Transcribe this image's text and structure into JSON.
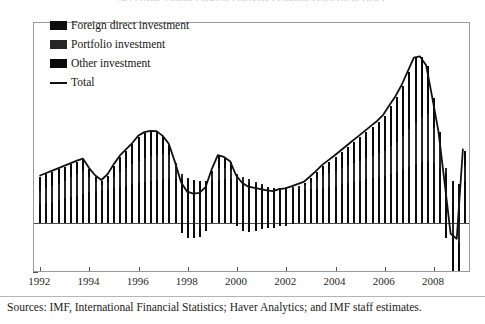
{
  "figure": {
    "title_clipped": "Net Private Capital Flows to Emerging Economies (percent of GDP)",
    "source_note": "Sources: IMF, International Financial Statistics; Haver Analytics; and IMF staff estimates."
  },
  "legend": {
    "position": "top-left-inside",
    "entries": [
      {
        "label": "Foreign direct investment",
        "key": "fdi",
        "marker": "filled-square",
        "color": "#0d0d0d"
      },
      {
        "label": "Portfolio investment",
        "key": "portfolio",
        "marker": "filled-square",
        "color": "#262626"
      },
      {
        "label": "Other investment",
        "key": "other",
        "marker": "filled-square",
        "color": "#0a0a0a"
      },
      {
        "label": "Total",
        "key": "total",
        "marker": "line",
        "color": "#111111"
      }
    ]
  },
  "chart_data": {
    "type": "bar",
    "subtype": "stacked-bar-with-overlay-line",
    "title": "Net Private Capital Flows to Emerging Economies (percent of GDP)",
    "xlabel": "",
    "ylabel": "",
    "ylim": [
      -2,
      8
    ],
    "yticks": [
      -2,
      0,
      2,
      4,
      6,
      8
    ],
    "ytick_labels": [
      "-2",
      "0",
      "2",
      "4",
      "6",
      "8"
    ],
    "xlim": [
      "1992Q1",
      "2009Q2"
    ],
    "xticks": [
      1992,
      1994,
      1996,
      1998,
      2000,
      2002,
      2004,
      2006,
      2008
    ],
    "xtick_labels": [
      "1992",
      "1994",
      "1996",
      "1998",
      "2000",
      "2002",
      "2004",
      "2006",
      "2008"
    ],
    "grid": false,
    "zero_line": true,
    "x": [
      "1992Q1",
      "1992Q2",
      "1992Q3",
      "1992Q4",
      "1993Q1",
      "1993Q2",
      "1993Q3",
      "1993Q4",
      "1994Q1",
      "1994Q2",
      "1994Q3",
      "1994Q4",
      "1995Q1",
      "1995Q2",
      "1995Q3",
      "1995Q4",
      "1996Q1",
      "1996Q2",
      "1996Q3",
      "1996Q4",
      "1997Q1",
      "1997Q2",
      "1997Q3",
      "1997Q4",
      "1998Q1",
      "1998Q2",
      "1998Q3",
      "1998Q4",
      "1999Q1",
      "1999Q2",
      "1999Q3",
      "1999Q4",
      "2000Q1",
      "2000Q2",
      "2000Q3",
      "2000Q4",
      "2001Q1",
      "2001Q2",
      "2001Q3",
      "2001Q4",
      "2002Q1",
      "2002Q2",
      "2002Q3",
      "2002Q4",
      "2003Q1",
      "2003Q2",
      "2003Q3",
      "2003Q4",
      "2004Q1",
      "2004Q2",
      "2004Q3",
      "2004Q4",
      "2005Q1",
      "2005Q2",
      "2005Q3",
      "2005Q4",
      "2006Q1",
      "2006Q2",
      "2006Q3",
      "2006Q4",
      "2007Q1",
      "2007Q2",
      "2007Q3",
      "2007Q4",
      "2008Q1",
      "2008Q2",
      "2008Q3",
      "2008Q4",
      "2009Q1",
      "2009Q2"
    ],
    "series": [
      {
        "name": "Foreign direct investment",
        "key": "fdi",
        "color": "#0d0d0d",
        "values": [
          0.75,
          0.8,
          0.85,
          0.92,
          1.0,
          1.05,
          1.1,
          1.18,
          1.25,
          1.3,
          1.32,
          1.35,
          1.4,
          1.45,
          1.5,
          1.55,
          1.6,
          1.65,
          1.7,
          1.72,
          1.75,
          1.78,
          1.8,
          1.78,
          1.75,
          1.72,
          1.7,
          1.68,
          1.7,
          1.72,
          1.75,
          1.78,
          1.7,
          1.65,
          1.6,
          1.55,
          1.5,
          1.45,
          1.42,
          1.4,
          1.38,
          1.36,
          1.35,
          1.34,
          1.35,
          1.38,
          1.42,
          1.46,
          1.5,
          1.55,
          1.6,
          1.65,
          1.7,
          1.75,
          1.8,
          1.85,
          1.9,
          1.98,
          2.05,
          2.15,
          2.25,
          2.35,
          2.45,
          2.5,
          2.4,
          2.25,
          2.0,
          1.7,
          1.55,
          1.7
        ]
      },
      {
        "name": "Portfolio investment",
        "key": "portfolio",
        "color": "#262626",
        "values": [
          0.55,
          0.6,
          0.62,
          0.65,
          0.7,
          0.8,
          0.85,
          0.9,
          0.6,
          0.35,
          0.2,
          0.3,
          0.45,
          0.6,
          0.7,
          0.8,
          0.9,
          0.95,
          1.0,
          1.02,
          1.0,
          0.95,
          0.6,
          0.2,
          0.05,
          -0.05,
          -0.1,
          0.0,
          0.3,
          0.5,
          0.45,
          0.35,
          0.25,
          0.2,
          0.15,
          0.1,
          0.05,
          0.0,
          -0.05,
          0.0,
          0.05,
          0.1,
          0.15,
          0.2,
          0.3,
          0.4,
          0.5,
          0.55,
          0.6,
          0.65,
          0.7,
          0.75,
          0.8,
          0.85,
          0.9,
          0.95,
          1.0,
          1.1,
          1.2,
          1.35,
          1.5,
          1.65,
          1.8,
          1.85,
          1.4,
          0.9,
          0.2,
          -0.6,
          -0.8,
          0.6
        ]
      },
      {
        "name": "Other investment",
        "key": "other",
        "color": "#0a0a0a",
        "values": [
          0.55,
          0.55,
          0.58,
          0.58,
          0.55,
          0.5,
          0.5,
          0.45,
          0.3,
          0.2,
          0.15,
          0.25,
          0.45,
          0.6,
          0.7,
          0.8,
          0.95,
          1.0,
          0.95,
          0.9,
          0.7,
          0.4,
          0.0,
          -0.4,
          -0.6,
          -0.55,
          -0.45,
          -0.3,
          0.1,
          0.45,
          0.4,
          0.3,
          -0.1,
          -0.3,
          -0.35,
          -0.3,
          -0.25,
          -0.2,
          -0.15,
          -0.1,
          -0.1,
          -0.05,
          0.0,
          0.05,
          0.15,
          0.25,
          0.35,
          0.45,
          0.55,
          0.65,
          0.75,
          0.85,
          0.95,
          1.05,
          1.15,
          1.25,
          1.4,
          1.6,
          1.8,
          2.0,
          2.3,
          2.6,
          2.4,
          1.95,
          1.2,
          0.5,
          -0.6,
          -1.6,
          -1.45,
          0.6
        ]
      }
    ],
    "total": {
      "name": "Total",
      "color": "#111111",
      "values": [
        1.85,
        1.95,
        2.05,
        2.15,
        2.25,
        2.35,
        2.45,
        2.53,
        2.15,
        1.85,
        1.67,
        1.9,
        2.3,
        2.65,
        2.9,
        3.15,
        3.45,
        3.6,
        3.65,
        3.64,
        3.45,
        3.13,
        2.4,
        1.58,
        1.2,
        1.12,
        1.15,
        1.38,
        2.1,
        2.67,
        2.6,
        2.43,
        1.85,
        1.55,
        1.4,
        1.35,
        1.3,
        1.25,
        1.22,
        1.3,
        1.33,
        1.41,
        1.5,
        1.59,
        1.8,
        2.03,
        2.27,
        2.46,
        2.65,
        2.85,
        3.05,
        3.25,
        3.45,
        3.65,
        3.85,
        4.05,
        4.3,
        4.68,
        5.05,
        5.5,
        6.05,
        6.6,
        6.65,
        6.3,
        5.0,
        3.65,
        1.6,
        -0.5,
        -0.7,
        2.9
      ]
    },
    "annotations": {
      "peak": {
        "period": "2007Q2",
        "value": 6.7
      },
      "trough": {
        "period": "2009Q1",
        "value": -1.5
      }
    }
  }
}
